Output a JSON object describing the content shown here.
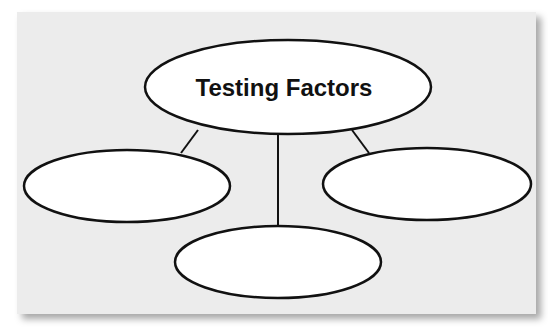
{
  "diagram": {
    "title": "Testing Factors",
    "colors": {
      "panel_background": "#ececec",
      "node_fill": "#ffffff",
      "stroke": "#111111"
    },
    "central_node": {
      "label": "Testing Factors"
    },
    "child_nodes": [
      {
        "position": "left",
        "label": ""
      },
      {
        "position": "bottom",
        "label": ""
      },
      {
        "position": "right",
        "label": ""
      }
    ],
    "connectors": [
      {
        "from": "Testing Factors",
        "to": "left"
      },
      {
        "from": "Testing Factors",
        "to": "bottom"
      },
      {
        "from": "Testing Factors",
        "to": "right"
      }
    ]
  }
}
